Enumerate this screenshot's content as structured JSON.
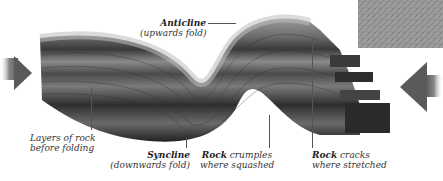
{
  "diagram": {
    "labels": {
      "layers": {
        "line1": "Layers of rock",
        "line2": "before folding"
      },
      "anticline": {
        "line1": "Anticline",
        "line2": "(upwards fold)"
      },
      "syncline": {
        "line1": "Syncline",
        "line2": "(downwards fold)"
      },
      "crumples": {
        "bold": "Rock",
        "rest": " crumples",
        "line2": "where squashed"
      },
      "cracks": {
        "bold": "Rock",
        "rest": " cracks",
        "line2": "where stretched"
      }
    },
    "arrows": [
      {
        "name": "compression-arrow-left",
        "direction": "right"
      },
      {
        "name": "compression-arrow-right",
        "direction": "left"
      }
    ],
    "inset": {
      "name": "rock-texture-photo"
    },
    "colors": {
      "rock_dark": "#2a2a2a",
      "rock_mid": "#6b6b6b",
      "rock_light": "#a8a8a8",
      "arrow": "#5a5a5a",
      "text": "#333333"
    }
  }
}
